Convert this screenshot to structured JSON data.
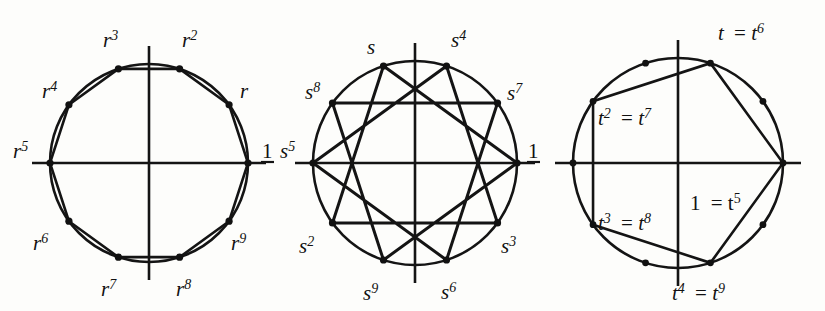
{
  "figure": {
    "background_color": "#fdfdfb",
    "ink_color": "#141414",
    "panel_count": 3
  },
  "panels": [
    {
      "id": "panel-r",
      "name": "primitive-10th-root-decagon",
      "description": "Regular decagon inscribed in circle; vertices are the powers of r",
      "center": {
        "x": 149,
        "y": 163
      },
      "radius": 99,
      "polygon_type": "decagon",
      "step": 1,
      "vertex_count": 10,
      "labels": [
        {
          "base": "1",
          "sup": "",
          "upright": true,
          "angle_deg": 0,
          "lx": 262,
          "ly": 158
        },
        {
          "base": "r",
          "sup": "",
          "upright": false,
          "angle_deg": 36,
          "lx": 240,
          "ly": 98
        },
        {
          "base": "r",
          "sup": "2",
          "upright": false,
          "angle_deg": 72,
          "lx": 182,
          "ly": 47
        },
        {
          "base": "r",
          "sup": "3",
          "upright": false,
          "angle_deg": 108,
          "lx": 103,
          "ly": 47
        },
        {
          "base": "r",
          "sup": "4",
          "upright": false,
          "angle_deg": 144,
          "lx": 42,
          "ly": 98
        },
        {
          "base": "r",
          "sup": "5",
          "upright": false,
          "angle_deg": 180,
          "lx": 13,
          "ly": 158
        },
        {
          "base": "r",
          "sup": "6",
          "upright": false,
          "angle_deg": 216,
          "lx": 33,
          "ly": 250
        },
        {
          "base": "r",
          "sup": "7",
          "upright": false,
          "angle_deg": 252,
          "lx": 101,
          "ly": 296
        },
        {
          "base": "r",
          "sup": "8",
          "upright": false,
          "angle_deg": 288,
          "lx": 176,
          "ly": 296
        },
        {
          "base": "r",
          "sup": "9",
          "upright": false,
          "angle_deg": 324,
          "lx": 231,
          "ly": 250
        }
      ]
    },
    {
      "id": "panel-s",
      "name": "star-polygon-10-3",
      "description": "Star polygon {10/3} inscribed in circle; vertices are the powers of s",
      "center": {
        "x": 415,
        "y": 163
      },
      "radius": 102,
      "polygon_type": "star",
      "step": 3,
      "vertex_count": 10,
      "labels": [
        {
          "base": "1",
          "sup": "",
          "upright": true,
          "angle_deg": 0,
          "lx": 528,
          "ly": 158
        },
        {
          "base": "s",
          "sup": "7",
          "upright": false,
          "angle_deg": 36,
          "lx": 507,
          "ly": 100
        },
        {
          "base": "s",
          "sup": "4",
          "upright": false,
          "angle_deg": 72,
          "lx": 451,
          "ly": 47
        },
        {
          "base": "s",
          "sup": "",
          "upright": false,
          "angle_deg": 108,
          "lx": 367,
          "ly": 54
        },
        {
          "base": "s",
          "sup": "8",
          "upright": false,
          "angle_deg": 144,
          "lx": 305,
          "ly": 99
        },
        {
          "base": "s",
          "sup": "5",
          "upright": false,
          "angle_deg": 180,
          "lx": 280,
          "ly": 158
        },
        {
          "base": "s",
          "sup": "2",
          "upright": false,
          "angle_deg": 216,
          "lx": 299,
          "ly": 253
        },
        {
          "base": "s",
          "sup": "9",
          "upright": false,
          "angle_deg": 252,
          "lx": 363,
          "ly": 300
        },
        {
          "base": "s",
          "sup": "6",
          "upright": false,
          "angle_deg": 288,
          "lx": 441,
          "ly": 299
        },
        {
          "base": "s",
          "sup": "3",
          "upright": false,
          "angle_deg": 324,
          "lx": 501,
          "ly": 253
        }
      ]
    },
    {
      "id": "panel-t",
      "name": "fifth-roots-pentagon",
      "description": "Regular pentagon inscribed in circle; t has order 5 so t^k equals t^(k+5)",
      "center": {
        "x": 678,
        "y": 163
      },
      "radius": 105,
      "polygon_type": "pentagon",
      "step": 2,
      "vertex_count": 5,
      "marker_count": 10,
      "labels": [
        {
          "base": "1",
          "sup": "",
          "eq_base": "t",
          "eq_sup": "5",
          "upright": true,
          "angle_deg": 0,
          "lx": 690,
          "ly": 210
        },
        {
          "base": "t",
          "sup": "",
          "eq_base": "t",
          "eq_sup": "6",
          "upright": false,
          "angle_deg": 72,
          "lx": 718,
          "ly": 40
        },
        {
          "base": "t",
          "sup": "2",
          "eq_base": "t",
          "eq_sup": "7",
          "upright": false,
          "angle_deg": 144,
          "lx": 598,
          "ly": 125
        },
        {
          "base": "t",
          "sup": "3",
          "eq_base": "t",
          "eq_sup": "8",
          "upright": false,
          "angle_deg": 216,
          "lx": 598,
          "ly": 230
        },
        {
          "base": "t",
          "sup": "4",
          "eq_base": "t",
          "eq_sup": "9",
          "upright": false,
          "angle_deg": 288,
          "lx": 672,
          "ly": 300
        }
      ]
    }
  ],
  "symbols": {
    "equals": "=",
    "one": "1"
  }
}
